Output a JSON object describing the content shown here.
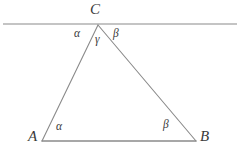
{
  "figure": {
    "type": "geometry-diagram",
    "stroke_color": "#8a8a8a",
    "label_color": "#3a3a3a",
    "background_color": "#ffffff",
    "width": 244,
    "height": 156
  },
  "points": {
    "A": {
      "label": "A",
      "x": 42,
      "y": 141
    },
    "B": {
      "label": "B",
      "x": 196,
      "y": 141
    },
    "C": {
      "label": "C",
      "x": 98,
      "y": 25
    }
  },
  "parallel_line": {
    "name": "line-through-C",
    "x1": 3,
    "y1": 24,
    "x2": 237,
    "y2": 24
  },
  "segments": [
    {
      "name": "side-AC",
      "x1": 42,
      "y1": 141,
      "x2": 98,
      "y2": 25
    },
    {
      "name": "side-CB",
      "x1": 98,
      "y1": 25,
      "x2": 196,
      "y2": 141
    },
    {
      "name": "side-AB",
      "x1": 42,
      "y1": 141,
      "x2": 196,
      "y2": 141
    }
  ],
  "angles": {
    "alpha_at_C": "α",
    "gamma_at_C": "γ",
    "beta_at_C": "β",
    "alpha_at_A": "α",
    "beta_at_B": "β"
  },
  "chart_data": {
    "type": "diagram",
    "title": "",
    "shapes": [
      {
        "kind": "triangle",
        "vertices": [
          [
            42,
            141
          ],
          [
            98,
            25
          ],
          [
            196,
            141
          ]
        ],
        "vertex_labels": [
          "A",
          "C",
          "B"
        ]
      },
      {
        "kind": "line",
        "from": [
          3,
          24
        ],
        "to": [
          237,
          24
        ],
        "note": "parallel to base AB, passes through C"
      }
    ],
    "annotations": [
      {
        "text": "C",
        "x": 98,
        "y": 10,
        "role": "vertex-label"
      },
      {
        "text": "A",
        "x": 33,
        "y": 137,
        "role": "vertex-label"
      },
      {
        "text": "B",
        "x": 205,
        "y": 137,
        "role": "vertex-label"
      },
      {
        "text": "α",
        "x": 79,
        "y": 34,
        "role": "angle-label"
      },
      {
        "text": "γ",
        "x": 99,
        "y": 40,
        "role": "angle-label"
      },
      {
        "text": "β",
        "x": 118,
        "y": 34,
        "role": "angle-label"
      },
      {
        "text": "α",
        "x": 61,
        "y": 127,
        "role": "angle-label"
      },
      {
        "text": "β",
        "x": 168,
        "y": 125,
        "role": "angle-label"
      }
    ]
  }
}
